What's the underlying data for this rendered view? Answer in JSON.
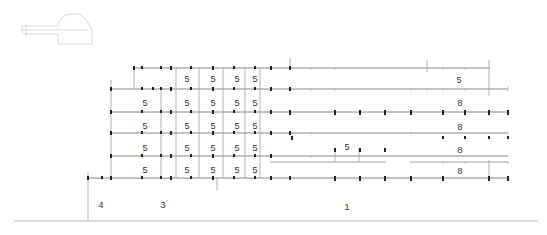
{
  "colors": {
    "line": "#8a8a8a",
    "faint": "#d0d0d0",
    "column": "#222222",
    "text": "#333333"
  },
  "floors_y": [
    68,
    89,
    112,
    133,
    156,
    178
  ],
  "ground_y": 221,
  "labels": [
    {
      "text": "5",
      "x": 187,
      "y": 79
    },
    {
      "text": "5",
      "x": 213,
      "y": 79
    },
    {
      "text": "5",
      "x": 237,
      "y": 79
    },
    {
      "text": "5",
      "x": 255,
      "y": 79
    },
    {
      "text": "5",
      "x": 145,
      "y": 103
    },
    {
      "text": "5",
      "x": 187,
      "y": 103
    },
    {
      "text": "5",
      "x": 213,
      "y": 103
    },
    {
      "text": "5",
      "x": 237,
      "y": 103
    },
    {
      "text": "5",
      "x": 255,
      "y": 103
    },
    {
      "text": "5",
      "x": 145,
      "y": 126
    },
    {
      "text": "5",
      "x": 187,
      "y": 126
    },
    {
      "text": "5",
      "x": 213,
      "y": 126
    },
    {
      "text": "5",
      "x": 237,
      "y": 126
    },
    {
      "text": "5",
      "x": 255,
      "y": 126
    },
    {
      "text": "5",
      "x": 145,
      "y": 148
    },
    {
      "text": "5",
      "x": 187,
      "y": 148
    },
    {
      "text": "5",
      "x": 213,
      "y": 148
    },
    {
      "text": "5",
      "x": 237,
      "y": 148
    },
    {
      "text": "5",
      "x": 255,
      "y": 148
    },
    {
      "text": "5",
      "x": 145,
      "y": 170
    },
    {
      "text": "5",
      "x": 187,
      "y": 170
    },
    {
      "text": "5",
      "x": 213,
      "y": 170
    },
    {
      "text": "5",
      "x": 237,
      "y": 170
    },
    {
      "text": "5",
      "x": 255,
      "y": 170
    },
    {
      "text": "5",
      "x": 459,
      "y": 80
    },
    {
      "text": "8",
      "x": 460,
      "y": 103
    },
    {
      "text": "8",
      "x": 460,
      "y": 127
    },
    {
      "text": "5",
      "x": 347,
      "y": 147
    },
    {
      "text": "8",
      "x": 460,
      "y": 150
    },
    {
      "text": "8",
      "x": 460,
      "y": 171
    },
    {
      "text": "4",
      "x": 101,
      "y": 205
    },
    {
      "text": "3",
      "x": 163,
      "y": 205
    },
    {
      "text": "1",
      "x": 347,
      "y": 207
    }
  ]
}
